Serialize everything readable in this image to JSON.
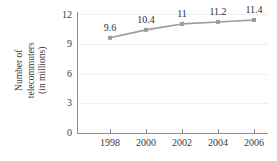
{
  "chart_data": {
    "type": "line",
    "title": "",
    "xlabel": "",
    "ylabel": "Number of telecommuters (in millions)",
    "ylabel_line1": "Number of",
    "ylabel_line2": "telecommuters",
    "ylabel_line3": "(in millions)",
    "categories": [
      "1998",
      "2000",
      "2002",
      "2004",
      "2006"
    ],
    "values": [
      9.6,
      10.4,
      11,
      11.2,
      11.4
    ],
    "point_labels": [
      "9.6",
      "10.4",
      "11",
      "11.2",
      "11.4"
    ],
    "ylim": [
      0,
      12
    ],
    "yticks": [
      0,
      3,
      6,
      9,
      12
    ],
    "ytick_labels": [
      "0",
      "3",
      "6",
      "9",
      "12"
    ],
    "xtick_labels": [
      "1998",
      "2000",
      "2002",
      "2004",
      "2006"
    ],
    "grid": true,
    "legend": "none",
    "colors": {
      "line": "#9b9b9b",
      "marker": "#9b9b9b",
      "gridline": "#efefef",
      "axis": "#8d8d8d",
      "text": "#3c3c3c",
      "background": "#ffffff"
    }
  }
}
